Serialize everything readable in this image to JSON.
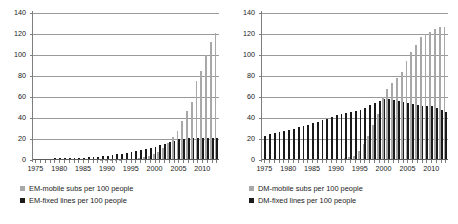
{
  "chart_data": [
    {
      "type": "bar",
      "title": "",
      "panel": "EM",
      "xlabel": "",
      "ylabel": "",
      "ylim": [
        0,
        140
      ],
      "yticks": [
        0,
        20,
        40,
        60,
        80,
        100,
        120,
        140
      ],
      "grid": true,
      "legend_position": "below",
      "xtick_labels": [
        "1975",
        "1980",
        "1985",
        "1990",
        "1995",
        "2000",
        "2005",
        "2010"
      ],
      "categories": [
        1975,
        1976,
        1977,
        1978,
        1979,
        1980,
        1981,
        1982,
        1983,
        1984,
        1985,
        1986,
        1987,
        1988,
        1989,
        1990,
        1991,
        1992,
        1993,
        1994,
        1995,
        1996,
        1997,
        1998,
        1999,
        2000,
        2001,
        2002,
        2003,
        2004,
        2005,
        2006,
        2007,
        2008,
        2009,
        2010,
        2011,
        2012,
        2013
      ],
      "series": [
        {
          "name": "EM-mobile subs per 100 people",
          "color": "#a8a8a8",
          "values": [
            0,
            0,
            0,
            0,
            0,
            0,
            0,
            0,
            0,
            0,
            0,
            0,
            0,
            0,
            0.1,
            0.1,
            0.2,
            0.3,
            0.4,
            0.6,
            0.9,
            1.3,
            1.9,
            2.6,
            3.8,
            5.5,
            8,
            11.5,
            16,
            22,
            28,
            37,
            47,
            55,
            75,
            85,
            100,
            112,
            121
          ]
        },
        {
          "name": "EM-fixed lines per 100 people",
          "color": "#1a1a1a",
          "values": [
            1.1,
            1.2,
            1.3,
            1.4,
            1.5,
            1.6,
            1.7,
            1.8,
            1.9,
            2.1,
            2.3,
            2.5,
            2.8,
            3.1,
            3.5,
            4,
            4.6,
            5.3,
            6,
            6.8,
            7.6,
            8.5,
            9.4,
            10.3,
            11.4,
            12.6,
            14,
            15.5,
            17,
            18.5,
            19.6,
            20.3,
            20.8,
            21,
            21.1,
            21.1,
            21,
            20.8,
            20.6
          ]
        }
      ]
    },
    {
      "type": "bar",
      "title": "",
      "panel": "DM",
      "xlabel": "",
      "ylabel": "",
      "ylim": [
        0,
        140
      ],
      "yticks": [
        0,
        20,
        40,
        60,
        80,
        100,
        120,
        140
      ],
      "grid": true,
      "legend_position": "below",
      "xtick_labels": [
        "1975",
        "1980",
        "1985",
        "1990",
        "1995",
        "2000",
        "2005",
        "2010"
      ],
      "categories": [
        1975,
        1976,
        1977,
        1978,
        1979,
        1980,
        1981,
        1982,
        1983,
        1984,
        1985,
        1986,
        1987,
        1988,
        1989,
        1990,
        1991,
        1992,
        1993,
        1994,
        1995,
        1996,
        1997,
        1998,
        1999,
        2000,
        2001,
        2002,
        2003,
        2004,
        2005,
        2006,
        2007,
        2008,
        2009,
        2010,
        2011,
        2012,
        2013
      ],
      "series": [
        {
          "name": "DM-mobile subs per 100 people",
          "color": "#a8a8a8",
          "values": [
            0,
            0,
            0,
            0,
            0,
            0,
            0,
            0,
            0,
            0,
            0,
            0,
            0,
            0,
            0,
            0.5,
            1,
            1.5,
            2.5,
            4,
            9,
            15,
            23,
            33,
            44,
            60,
            68,
            73,
            78,
            84,
            94,
            103,
            110,
            117,
            120,
            122,
            125,
            127,
            127
          ]
        },
        {
          "name": "DM-fixed lines per 100 people",
          "color": "#1a1a1a",
          "values": [
            23,
            25,
            26,
            27,
            28,
            29,
            30,
            31,
            32,
            33,
            35,
            36,
            38,
            39,
            41,
            43,
            44,
            45,
            46,
            47,
            48,
            50,
            52,
            54,
            56,
            58,
            58,
            57,
            56,
            55,
            54,
            53,
            52,
            51,
            51,
            51,
            50,
            48,
            46
          ]
        }
      ]
    }
  ],
  "panels": [
    {
      "id": "em",
      "legend": [
        {
          "label": "EM-mobile subs per 100 people",
          "marker": "square-gray-icon"
        },
        {
          "label": "EM-fixed lines per 100 people",
          "marker": "square-black-icon"
        }
      ]
    },
    {
      "id": "dm",
      "legend": [
        {
          "label": "DM-mobile subs per 100 people",
          "marker": "square-gray-icon"
        },
        {
          "label": "DM-fixed lines per 100 people",
          "marker": "square-black-icon"
        }
      ]
    }
  ],
  "colors": {
    "mobile": "#a8a8a8",
    "fixed": "#1a1a1a",
    "grid": "#9a9a9a",
    "axis": "#7d7d7d",
    "background": "#ffffff"
  }
}
